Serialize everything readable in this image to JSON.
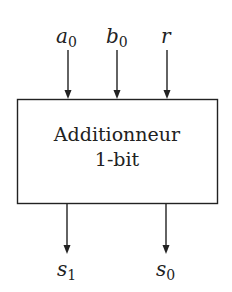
{
  "diagram": {
    "type": "block-diagram",
    "block": {
      "label_line1": "Additionneur",
      "label_line2": "1-bit"
    },
    "inputs": [
      {
        "name": "a",
        "sub": "0"
      },
      {
        "name": "b",
        "sub": "0"
      },
      {
        "name": "r",
        "sub": ""
      }
    ],
    "outputs": [
      {
        "name": "s",
        "sub": "1"
      },
      {
        "name": "s",
        "sub": "0"
      }
    ],
    "colors": {
      "stroke": "#222222",
      "background": "#ffffff"
    }
  }
}
